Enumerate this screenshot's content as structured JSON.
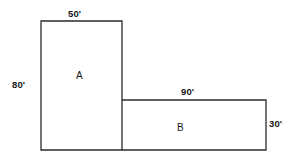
{
  "figure": {
    "background_color": "#ffffff",
    "stroke_color": "#2b2b2b",
    "stroke_width": 1.3,
    "text_color": "#161616",
    "unit_symbol": "'",
    "regions": [
      {
        "id": "A",
        "label": "A",
        "shape": "rectangle",
        "width_value": 50,
        "height_value": 80,
        "width_label": "50'",
        "height_label": "80'"
      },
      {
        "id": "B",
        "label": "B",
        "shape": "rectangle",
        "width_value": 90,
        "height_value": 30,
        "width_label": "90'",
        "height_label": "30'"
      }
    ],
    "dimension_labels": {
      "top_a": "50'",
      "left_a": "80'",
      "top_b": "90'",
      "right_b": "30'"
    },
    "outline_path": "M41,21 L122,21 L122,100 L266,100 L266,150 L41,150 Z",
    "divider_line": {
      "x1": 122,
      "y1": 100,
      "x2": 122,
      "y2": 150
    }
  },
  "chart_data": {
    "type": "diagram",
    "units": "feet",
    "shapes": [
      {
        "name": "A",
        "type": "rectangle",
        "width": 50,
        "height": 80,
        "px": {
          "x": 41,
          "y": 21,
          "w": 81,
          "h": 129
        }
      },
      {
        "name": "B",
        "type": "rectangle",
        "width": 90,
        "height": 30,
        "px": {
          "x": 122,
          "y": 100,
          "w": 144,
          "h": 50
        }
      }
    ],
    "annotations": [
      "50'",
      "80'",
      "90'",
      "30'",
      "A",
      "B"
    ]
  }
}
